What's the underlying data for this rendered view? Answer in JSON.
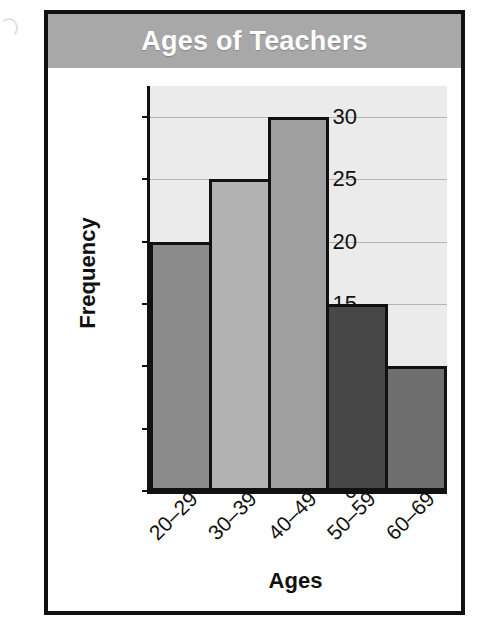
{
  "figure": {
    "title": "Ages of Teachers",
    "title_bar_color": "#a8a8a8",
    "title_text_color": "#ffffff",
    "frame_color": "#111111",
    "plot_background": "#ebebeb",
    "gridline_color": "#b4b4b4"
  },
  "chart_data": {
    "type": "bar",
    "title": "Ages of Teachers",
    "xlabel": "Ages",
    "ylabel": "Frequency",
    "categories": [
      "20–29",
      "30–39",
      "40–49",
      "50–59",
      "60–69"
    ],
    "values": [
      20,
      25,
      30,
      15,
      10
    ],
    "bar_colors": [
      "#8a8a8a",
      "#b2b2b2",
      "#a0a0a0",
      "#474747",
      "#6e6e6e"
    ],
    "bar_border_color": "#111111",
    "ylim": [
      0,
      32.5
    ],
    "yticks": [
      0,
      5,
      10,
      15,
      20,
      25,
      30
    ],
    "ytick_labels": [
      "0",
      "5",
      "10",
      "15",
      "20",
      "25",
      "30"
    ],
    "grid": true,
    "grid_axis": "y",
    "legend": false,
    "xtick_rotation": -45,
    "bars_adjacent": true
  }
}
